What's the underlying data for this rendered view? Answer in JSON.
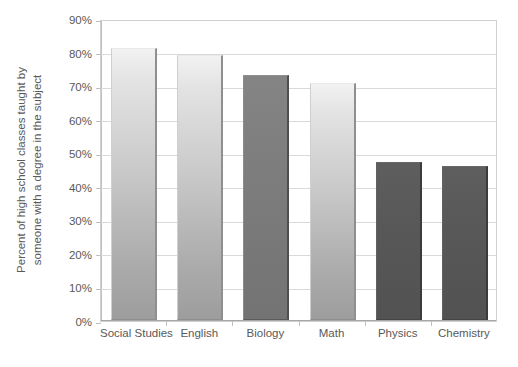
{
  "chart_data": {
    "type": "bar",
    "title": "",
    "xlabel": "",
    "ylabel": "Percent of high school classes taught by someone with a degree in the subject",
    "ylabel_lines": [
      "Percent of high school classes taught by",
      "someone with a degree in the subject"
    ],
    "categories": [
      "Social Studies",
      "English",
      "Biology",
      "Math",
      "Physics",
      "Chemistry"
    ],
    "values": [
      81,
      79,
      73,
      70.5,
      47,
      46
    ],
    "value_labels": [
      "81%",
      "79%",
      "73%",
      "70%",
      "47%",
      "46%"
    ],
    "ylim": [
      0,
      90
    ],
    "y_tick_values": [
      0,
      10,
      20,
      30,
      40,
      50,
      60,
      70,
      80,
      90
    ],
    "y_tick_labels": [
      "0%",
      "10%",
      "20%",
      "30%",
      "40%",
      "50%",
      "60%",
      "70%",
      "80%",
      "90%"
    ],
    "grid": true,
    "legend": false,
    "legend_position": "none",
    "bar_styles": [
      "light",
      "light",
      "medium",
      "light",
      "dark",
      "dark"
    ],
    "colors": {
      "bar_light_top": "#f2f2f2",
      "bar_light_bottom": "#9d9d9d",
      "bar_medium": "#7d7d7d",
      "bar_dark": "#585858",
      "gridline": "#d9d9d9",
      "axis": "#bfbfbf",
      "plot_border": "#d0d0d0",
      "text": "#595959",
      "background": "#ffffff"
    }
  }
}
